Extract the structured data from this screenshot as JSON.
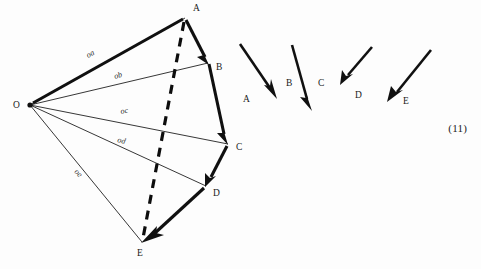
{
  "figure": {
    "caption_number": "(11)",
    "background_color": "#fdfdfd",
    "ink_color": "#111111"
  },
  "polygon_diagram": {
    "name": "ray-polygon-with-dashed-closing-line",
    "origin": {
      "label": "O",
      "x": 30,
      "y": 105
    },
    "vertices": [
      {
        "label": "A",
        "x": 185,
        "y": 18,
        "label_x": 193,
        "label_y": 11
      },
      {
        "label": "B",
        "x": 208,
        "y": 63,
        "label_x": 216,
        "label_y": 70
      },
      {
        "label": "C",
        "x": 228,
        "y": 144,
        "label_x": 236,
        "label_y": 150
      },
      {
        "label": "D",
        "x": 206,
        "y": 186,
        "label_x": 213,
        "label_y": 196
      },
      {
        "label": "E",
        "x": 142,
        "y": 242,
        "label_x": 137,
        "label_y": 256
      }
    ],
    "ray_labels": [
      {
        "text": "oa",
        "x": 88,
        "y": 58,
        "rotate": -29
      },
      {
        "text": "ob",
        "x": 115,
        "y": 79,
        "rotate": -18
      },
      {
        "text": "oc",
        "x": 121,
        "y": 114,
        "rotate": -12
      },
      {
        "text": "od",
        "x": 117,
        "y": 142,
        "rotate": 14
      },
      {
        "text": "oe",
        "x": 74,
        "y": 172,
        "rotate": 47
      }
    ],
    "chain_description": "thick polyline O-A then A->B->C->D->E with arrowheads",
    "dashed_description": "dashed line from A to E"
  },
  "free_vectors": {
    "name": "separated-vector-arrows",
    "items": [
      {
        "label": "a",
        "display": "A",
        "x1": 240,
        "y1": 44,
        "x2": 276,
        "y2": 97,
        "label_x": 243,
        "label_y": 102
      },
      {
        "label": "b",
        "display": "B",
        "x1": 292,
        "y1": 45,
        "x2": 311,
        "y2": 110,
        "label_x": 288,
        "label_y": 86
      },
      {
        "label": "c",
        "display": "C",
        "x1": 292,
        "y1": 45,
        "x2": 311,
        "y2": 110,
        "label_x": 319,
        "label_y": 86
      },
      {
        "label": "d",
        "display": "D",
        "x1": 372,
        "y1": 47,
        "x2": 341,
        "y2": 84,
        "label_x": 357,
        "label_y": 98
      },
      {
        "label": "e",
        "display": "E",
        "x1": 431,
        "y1": 50,
        "x2": 388,
        "y2": 100,
        "label_x": 404,
        "label_y": 104
      }
    ]
  }
}
